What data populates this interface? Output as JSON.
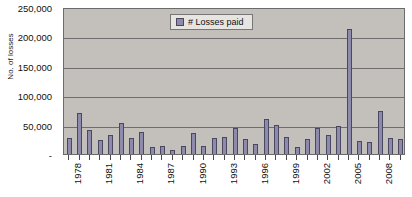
{
  "chart_data": {
    "type": "bar",
    "title": "",
    "xlabel": "",
    "ylabel": "No. of losses",
    "ylim": [
      0,
      250000
    ],
    "yticks": [
      "-",
      "50,000",
      "100,000",
      "150,000",
      "200,000",
      "250,000"
    ],
    "ytick_values": [
      0,
      50000,
      100000,
      150000,
      200000,
      250000
    ],
    "grid": true,
    "legend_position": "top-center",
    "series": [
      {
        "name": "# Losses paid",
        "color": "#8e8aab",
        "values": [
          28000,
          69000,
          41000,
          23000,
          32000,
          52000,
          27000,
          38000,
          12000,
          13000,
          6000,
          14000,
          35000,
          13000,
          27000,
          29000,
          44000,
          26000,
          17000,
          60000,
          50000,
          29000,
          12000,
          26000,
          44000,
          33000,
          48000,
          212000,
          22000,
          21000,
          73000,
          27000,
          25000
        ]
      }
    ],
    "categories": [
      "1978",
      "1979",
      "1980",
      "1981",
      "1982",
      "1983",
      "1984",
      "1985",
      "1986",
      "1987",
      "1988",
      "1989",
      "1990",
      "1991",
      "1992",
      "1993",
      "1994",
      "1995",
      "1996",
      "1997",
      "1998",
      "1999",
      "2000",
      "2001",
      "2002",
      "2003",
      "2004",
      "2005",
      "2006",
      "2007",
      "2008",
      "2009",
      "2010"
    ],
    "visible_xtick_labels": [
      "1978",
      "1981",
      "1984",
      "1987",
      "1990",
      "1993",
      "1996",
      "1999",
      "2002",
      "2005",
      "2008"
    ],
    "xtick_label_interval": 3
  },
  "legend": {
    "label": "# Losses paid"
  },
  "axes": {
    "y_title": "No. of losses",
    "title_text": ""
  },
  "colors": {
    "bar_fill": "#8e8aab",
    "bar_stroke": "#4a4760",
    "plot_background": "#c3bfbb",
    "gridline": "#6d6d6d",
    "axis": "#4a4a4a",
    "text": "#111111",
    "legend_background": "#e7e5e2"
  }
}
